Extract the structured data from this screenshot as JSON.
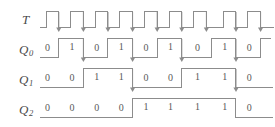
{
  "diagram": {
    "type": "timing-diagram",
    "line_color": "#8c8c8c",
    "text_color": "#595959",
    "background": "#ffffff",
    "num_clock_pulses": 9,
    "edge_trigger": "falling"
  },
  "rows": [
    {
      "id": "T",
      "label": "T",
      "subscript": "",
      "kind": "clock",
      "values": [],
      "arrows": true
    },
    {
      "id": "Q0",
      "label": "Q",
      "subscript": "0",
      "kind": "signal",
      "values": [
        "0",
        "1",
        "0",
        "1",
        "0",
        "1",
        "0",
        "1",
        "0"
      ],
      "arrows": true
    },
    {
      "id": "Q1",
      "label": "Q",
      "subscript": "1",
      "kind": "signal",
      "values": [
        "0",
        "0",
        "1",
        "1",
        "0",
        "0",
        "1",
        "1",
        "0"
      ],
      "arrows": true
    },
    {
      "id": "Q2",
      "label": "Q",
      "subscript": "2",
      "kind": "signal",
      "values": [
        "0",
        "0",
        "0",
        "0",
        "1",
        "1",
        "1",
        "1",
        "0"
      ],
      "arrows": false
    }
  ],
  "chart_data": {
    "type": "line",
    "xlabel": "",
    "ylabel": "",
    "categories": [
      "1",
      "2",
      "3",
      "4",
      "5",
      "6",
      "7",
      "8",
      "9"
    ],
    "series": [
      {
        "name": "T",
        "values": [
          1,
          1,
          1,
          1,
          1,
          1,
          1,
          1,
          1
        ]
      },
      {
        "name": "Q0",
        "values": [
          0,
          1,
          0,
          1,
          0,
          1,
          0,
          1,
          0
        ]
      },
      {
        "name": "Q1",
        "values": [
          0,
          0,
          1,
          1,
          0,
          0,
          1,
          1,
          0
        ]
      },
      {
        "name": "Q2",
        "values": [
          0,
          0,
          0,
          0,
          1,
          1,
          1,
          1,
          0
        ]
      }
    ]
  }
}
